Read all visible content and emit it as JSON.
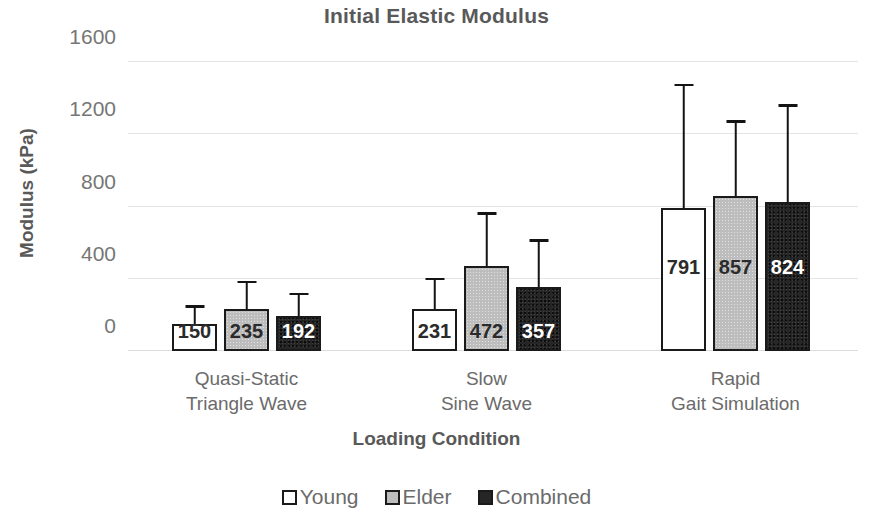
{
  "chart_data": {
    "type": "bar",
    "title": "Initial Elastic Modulus",
    "xlabel": "Loading Condition",
    "ylabel": "Modulus (kPa)",
    "ylim": [
      0,
      1600
    ],
    "yticks": [
      0,
      400,
      800,
      1200,
      1600
    ],
    "ytick_labels": [
      "0",
      "400",
      "800",
      "1200",
      "1600"
    ],
    "grid": "horizontal",
    "legend_position": "bottom",
    "categories": [
      "Quasi-Static\nTriangle Wave",
      "Slow\nSine Wave",
      "Rapid\nGait Simulation"
    ],
    "category_lines": [
      [
        "Quasi-Static",
        "Triangle Wave"
      ],
      [
        "Slow",
        "Sine Wave"
      ],
      [
        "Rapid",
        "Gait Simulation"
      ]
    ],
    "series": [
      {
        "name": "Young",
        "color": "#ffffff",
        "values": [
          150,
          231,
          791
        ],
        "labels": [
          "150",
          "231",
          "791"
        ],
        "error_high": [
          240,
          391,
          1465
        ]
      },
      {
        "name": "Elder",
        "color": "#bdbdbd",
        "values": [
          235,
          472,
          857
        ],
        "labels": [
          "235",
          "472",
          "857"
        ],
        "error_high": [
          374,
          755,
          1264
        ]
      },
      {
        "name": "Combined",
        "color": "#262626",
        "values": [
          192,
          357,
          824
        ],
        "labels": [
          "192",
          "357",
          "824"
        ],
        "error_high": [
          308,
          604,
          1353
        ]
      }
    ]
  },
  "legend": {
    "items": [
      {
        "label": "Young",
        "swatch": "young"
      },
      {
        "label": "Elder",
        "swatch": "elder"
      },
      {
        "label": "Combined",
        "swatch": "combined"
      }
    ]
  },
  "colors": {
    "text": "#595959",
    "tick_text": "#767676",
    "gridline": "#e4e4e4",
    "bar_outline": "#1a1a1a",
    "young_fill": "#ffffff",
    "elder_fill": "#bdbdbd",
    "combined_fill": "#262626"
  }
}
